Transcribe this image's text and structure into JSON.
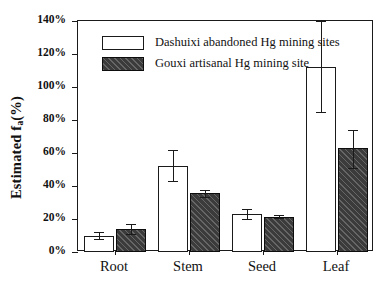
{
  "chart_data": {
    "type": "bar",
    "title": "",
    "xlabel": "",
    "ylabel_text": "Estimated f",
    "ylabel_sub": "a",
    "ylabel_unit": "(%)",
    "ylabel_full": "Estimated fa(%)",
    "categories": [
      "Root",
      "Stem",
      "Seed",
      "Leaf"
    ],
    "ylim": [
      0,
      140
    ],
    "ytick_values": [
      0,
      20,
      40,
      60,
      80,
      100,
      120,
      140
    ],
    "ytick_labels": [
      "0%",
      "20%",
      "40%",
      "60%",
      "80%",
      "100%",
      "120%",
      "140%"
    ],
    "grid": false,
    "legend_position": "top-left-inside",
    "series": [
      {
        "name": "Dashuixi abandoned Hg mining sites",
        "style": "open-white-bar",
        "color": "#ffffff",
        "edge_color": "#1a1a1a",
        "values": [
          10,
          52,
          23,
          112
        ],
        "errors_low": [
          2,
          9,
          3,
          27
        ],
        "errors_high": [
          2,
          10,
          3,
          28
        ]
      },
      {
        "name": "Gouxi artisanal Hg mining site",
        "style": "dark-hatched-bar",
        "color": "#3b3b3b",
        "edge_color": "#0d0d0d",
        "values": [
          14,
          35.5,
          21.5,
          63
        ],
        "errors_low": [
          3,
          2,
          1,
          12
        ],
        "errors_high": [
          3,
          2,
          1,
          11
        ]
      }
    ]
  },
  "legend": {
    "items": [
      {
        "label": "Dashuixi abandoned Hg mining sites",
        "swatch": "open-white-swatch"
      },
      {
        "label": "Gouxi artisanal Hg mining site",
        "swatch": "dark-hatched-swatch"
      }
    ]
  }
}
